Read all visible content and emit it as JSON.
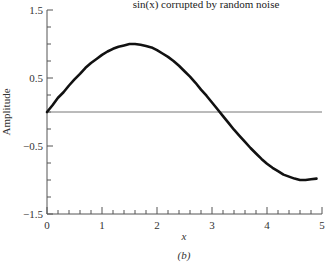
{
  "chart_data": {
    "type": "line",
    "title": "sin(x) corrupted by random noise",
    "xlabel": "x",
    "ylabel": "Amplitude",
    "caption": "(b)",
    "xlim": [
      0,
      5
    ],
    "ylim": [
      -1.5,
      1.5
    ],
    "x_ticks": [
      "0",
      "1",
      "2",
      "3",
      "4",
      "5"
    ],
    "y_ticks": [
      "1.5",
      "0.5",
      "-0.5",
      "-1.5"
    ],
    "grid": false,
    "legend": null,
    "reference_line": {
      "y": 0
    },
    "series": [
      {
        "name": "sin(x) + noise",
        "x": [
          0,
          0.1,
          0.2,
          0.3,
          0.4,
          0.5,
          0.6,
          0.7,
          0.8,
          0.9,
          1.0,
          1.1,
          1.2,
          1.3,
          1.4,
          1.5,
          1.6,
          1.7,
          1.8,
          1.9,
          2.0,
          2.1,
          2.2,
          2.3,
          2.4,
          2.5,
          2.6,
          2.7,
          2.8,
          2.9,
          3.0,
          3.1,
          3.2,
          3.3,
          3.4,
          3.5,
          3.6,
          3.7,
          3.8,
          3.9,
          4.0,
          4.1,
          4.2,
          4.3,
          4.4,
          4.5,
          4.6,
          4.7,
          4.8,
          4.9
        ],
        "y": [
          0.0,
          0.1,
          0.21,
          0.29,
          0.39,
          0.48,
          0.56,
          0.65,
          0.72,
          0.78,
          0.84,
          0.89,
          0.93,
          0.96,
          0.98,
          1.0,
          1.0,
          0.99,
          0.97,
          0.95,
          0.91,
          0.86,
          0.81,
          0.75,
          0.68,
          0.6,
          0.52,
          0.43,
          0.33,
          0.24,
          0.14,
          0.04,
          -0.06,
          -0.16,
          -0.26,
          -0.35,
          -0.44,
          -0.53,
          -0.61,
          -0.69,
          -0.76,
          -0.82,
          -0.87,
          -0.92,
          -0.95,
          -0.98,
          -1.0,
          -1.0,
          -0.99,
          -0.98
        ]
      }
    ]
  }
}
